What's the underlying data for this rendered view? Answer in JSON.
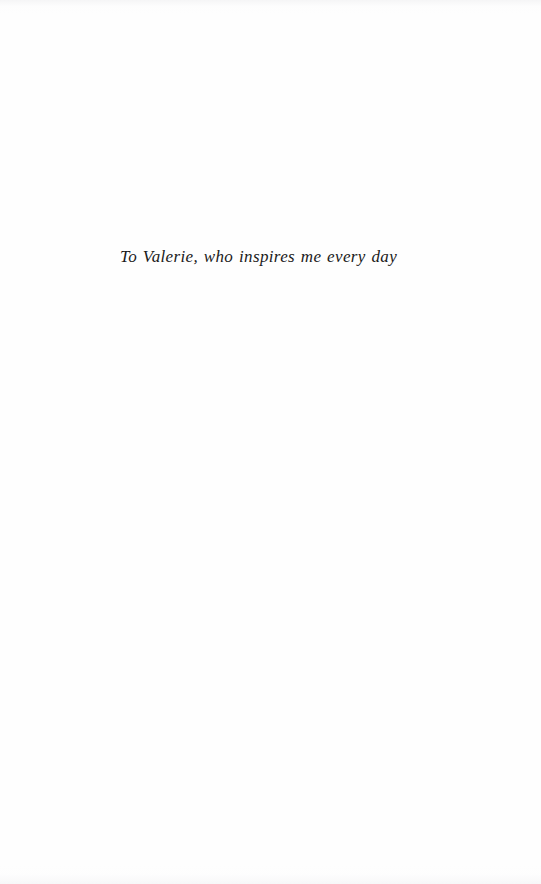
{
  "page": {
    "kind": "book-dedication-page",
    "background_color": "#fefefe",
    "width": 541,
    "height": 884
  },
  "dedication": {
    "text": "To Valerie, who inspires me every day",
    "text_color": "#1a1a1a",
    "style": "italic-serif",
    "alignment": "center"
  }
}
